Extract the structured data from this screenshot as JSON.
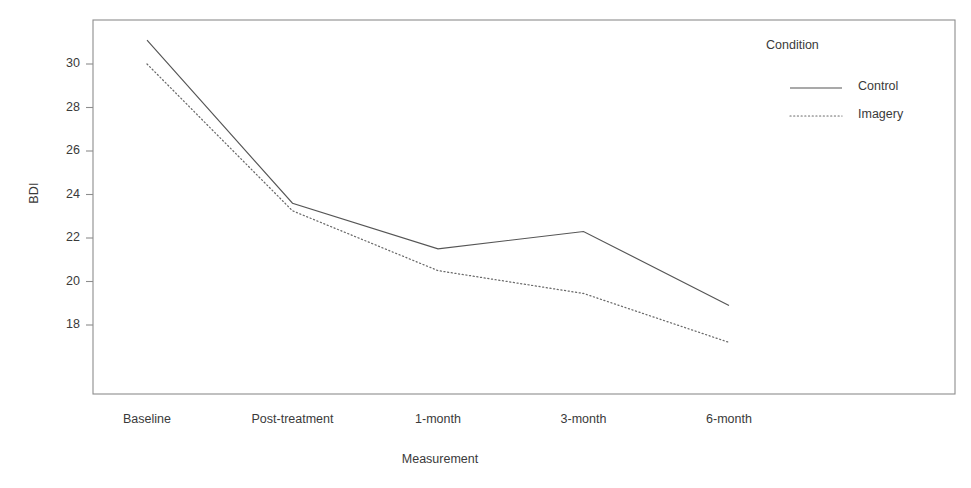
{
  "chart_data": {
    "type": "line",
    "title": "",
    "subtitle": "",
    "xlabel": "Measurement",
    "ylabel": "BDI",
    "categories": [
      "Baseline",
      "Post-treatment",
      "1-month",
      "3-month",
      "6-month"
    ],
    "series": [
      {
        "name": "Control",
        "style": "solid",
        "color": "#555555",
        "values": [
          31.1,
          23.6,
          21.5,
          22.3,
          18.9
        ]
      },
      {
        "name": "Imagery",
        "style": "dotted",
        "color": "#6a6a6a",
        "values": [
          30.0,
          23.25,
          20.5,
          19.45,
          17.2
        ]
      }
    ],
    "ylim": [
      16.2,
      31.4
    ],
    "yticks": [
      18,
      20,
      22,
      24,
      26,
      28,
      30
    ],
    "ytick_labels": [
      "18",
      "20",
      "22",
      "24",
      "26",
      "28",
      "30"
    ],
    "grid": false,
    "legend": {
      "title": "Condition",
      "position": "top-right-outside",
      "entries": [
        {
          "label": "Control",
          "style": "solid"
        },
        {
          "label": "Imagery",
          "style": "dotted"
        }
      ]
    },
    "frame": true
  }
}
